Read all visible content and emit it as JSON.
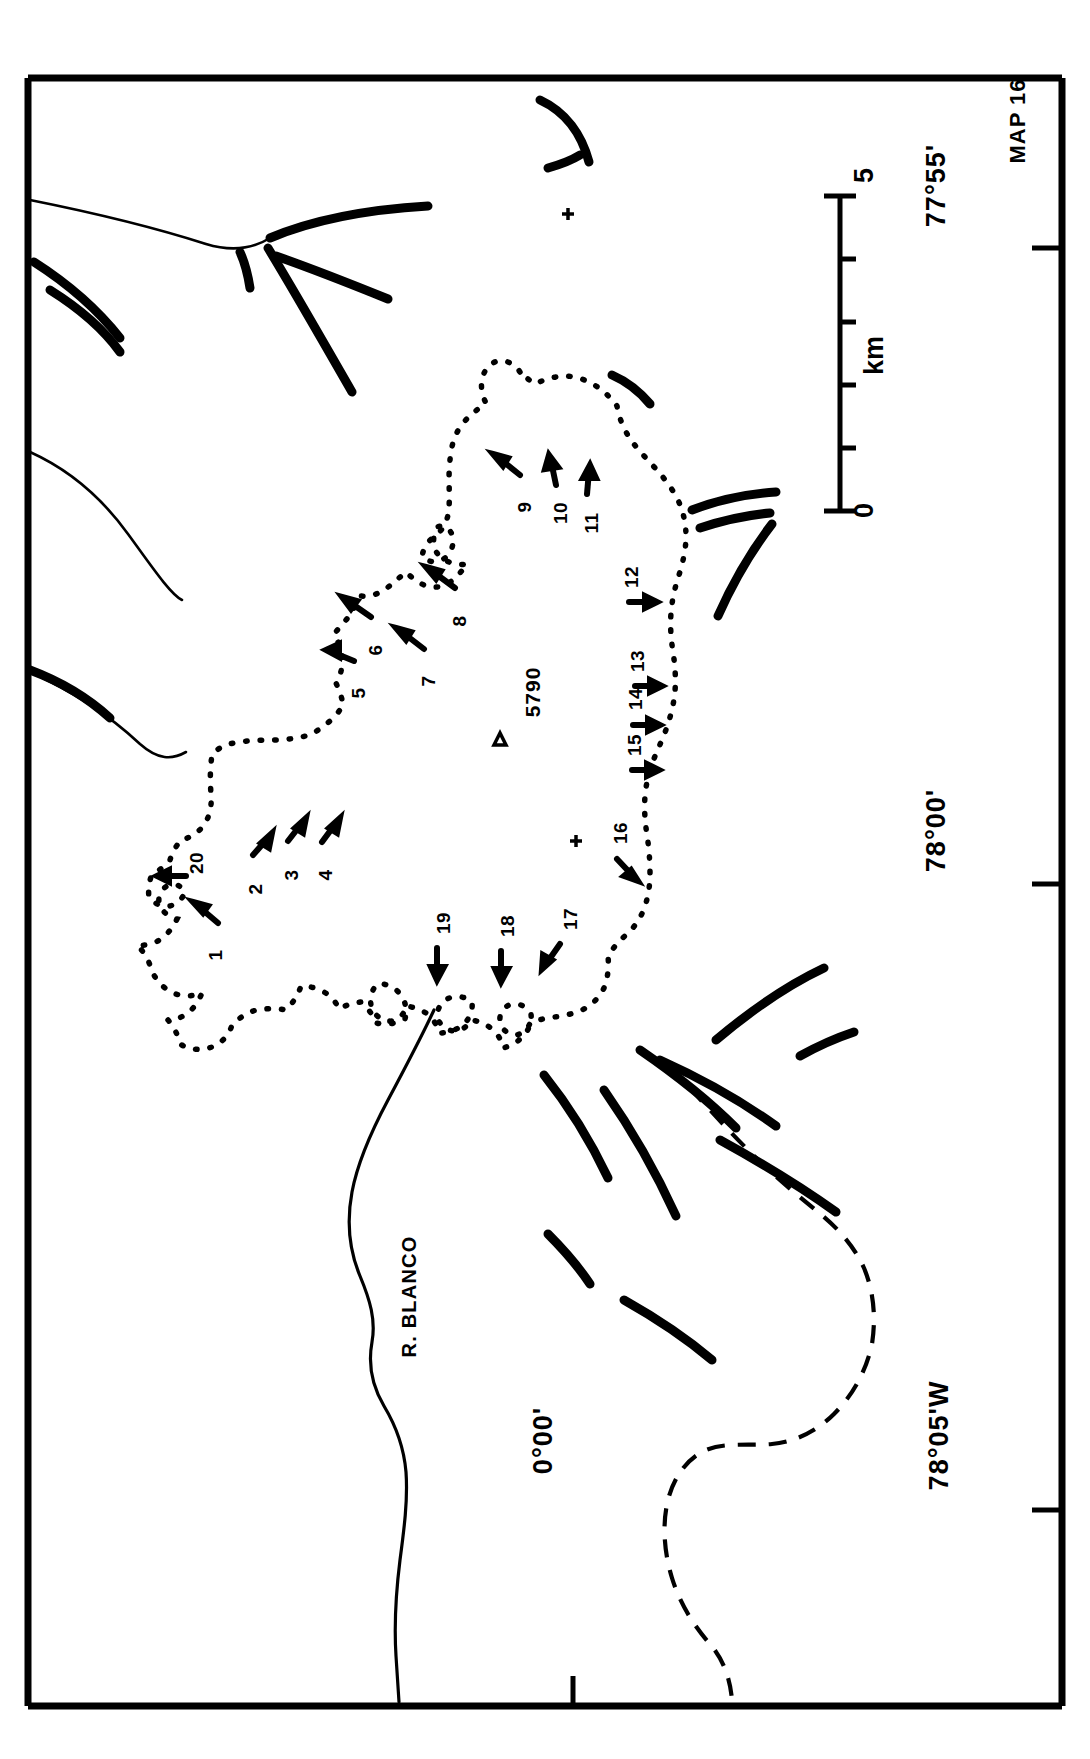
{
  "map": {
    "sheet_label": "MAP 16",
    "title_region": "Glacier outline map",
    "summit": {
      "symbol": "△",
      "elevation": "5790"
    },
    "river_label": "R. BLANCO",
    "coordinates": [
      {
        "name": "longitude-77-55",
        "text": "77°55'",
        "position": "top-right"
      },
      {
        "name": "longitude-78-00",
        "text": "78°00'",
        "position": "bottom-right-middle"
      },
      {
        "name": "longitude-78-05",
        "text": "78°05'W",
        "position": "bottom-right"
      },
      {
        "name": "latitude-0-00",
        "text": "0°00'",
        "position": "bottom-left"
      }
    ],
    "scalebar": {
      "min_label": "0",
      "max_label": "5",
      "unit_label": "km",
      "ticks": [
        0,
        1,
        2,
        3,
        4,
        5
      ]
    },
    "arrow_labels": [
      {
        "id": "1",
        "text": "1"
      },
      {
        "id": "2",
        "text": "2"
      },
      {
        "id": "3",
        "text": "3"
      },
      {
        "id": "4",
        "text": "4"
      },
      {
        "id": "5",
        "text": "5"
      },
      {
        "id": "6",
        "text": "6"
      },
      {
        "id": "7",
        "text": "7"
      },
      {
        "id": "8",
        "text": "8"
      },
      {
        "id": "9",
        "text": "9"
      },
      {
        "id": "10",
        "text": "10"
      },
      {
        "id": "11",
        "text": "11"
      },
      {
        "id": "12",
        "text": "12"
      },
      {
        "id": "13",
        "text": "13"
      },
      {
        "id": "14",
        "text": "14"
      },
      {
        "id": "15",
        "text": "15"
      },
      {
        "id": "16",
        "text": "16"
      },
      {
        "id": "17",
        "text": "17"
      },
      {
        "id": "18",
        "text": "18"
      },
      {
        "id": "19",
        "text": "19"
      },
      {
        "id": "20",
        "text": "20"
      }
    ],
    "colors": {
      "ink": "#000000",
      "paper": "#ffffff"
    }
  }
}
